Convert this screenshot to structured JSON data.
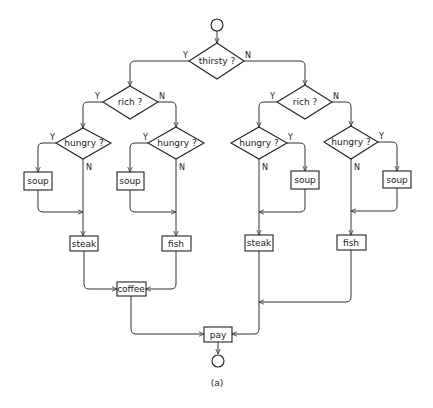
{
  "diagram": {
    "caption": "(a)",
    "nodes": {
      "start": {
        "type": "terminal"
      },
      "thirsty": {
        "type": "decision",
        "label": "thirsty ?",
        "yes": "Y",
        "no": "N"
      },
      "rich_left": {
        "type": "decision",
        "label": "rich ?",
        "yes": "Y",
        "no": "N"
      },
      "rich_right": {
        "type": "decision",
        "label": "rich ?",
        "yes": "Y",
        "no": "N"
      },
      "hungry_1": {
        "type": "decision",
        "label": "hungry ?",
        "yes": "Y",
        "no": "N"
      },
      "hungry_2": {
        "type": "decision",
        "label": "hungry ?",
        "yes": "Y",
        "no": "N"
      },
      "hungry_3": {
        "type": "decision",
        "label": "hungry ?",
        "yes": "Y",
        "no": "N"
      },
      "hungry_4": {
        "type": "decision",
        "label": "hungry ?",
        "yes": "Y",
        "no": "N"
      },
      "soup_1": {
        "type": "process",
        "label": "soup"
      },
      "soup_2": {
        "type": "process",
        "label": "soup"
      },
      "soup_3": {
        "type": "process",
        "label": "soup"
      },
      "soup_4": {
        "type": "process",
        "label": "soup"
      },
      "steak_left": {
        "type": "process",
        "label": "steak"
      },
      "fish_left": {
        "type": "process",
        "label": "fish"
      },
      "steak_right": {
        "type": "process",
        "label": "steak"
      },
      "fish_right": {
        "type": "process",
        "label": "fish"
      },
      "coffee": {
        "type": "process",
        "label": "coffee"
      },
      "pay": {
        "type": "process",
        "label": "pay"
      },
      "end": {
        "type": "terminal"
      }
    },
    "edges": [
      {
        "from": "start",
        "to": "thirsty"
      },
      {
        "from": "thirsty",
        "to": "rich_left",
        "label": "Y"
      },
      {
        "from": "thirsty",
        "to": "rich_right",
        "label": "N"
      },
      {
        "from": "rich_left",
        "to": "hungry_1",
        "label": "Y"
      },
      {
        "from": "rich_left",
        "to": "hungry_2",
        "label": "N"
      },
      {
        "from": "rich_right",
        "to": "hungry_3",
        "label": "Y"
      },
      {
        "from": "rich_right",
        "to": "hungry_4",
        "label": "N"
      },
      {
        "from": "hungry_1",
        "to": "soup_1",
        "label": "Y"
      },
      {
        "from": "hungry_1",
        "to": "steak_left",
        "label": "N"
      },
      {
        "from": "soup_1",
        "to": "steak_left"
      },
      {
        "from": "hungry_2",
        "to": "soup_2",
        "label": "Y"
      },
      {
        "from": "hungry_2",
        "to": "fish_left",
        "label": "N"
      },
      {
        "from": "soup_2",
        "to": "fish_left"
      },
      {
        "from": "hungry_3",
        "to": "soup_3",
        "label": "Y"
      },
      {
        "from": "hungry_3",
        "to": "steak_right",
        "label": "N"
      },
      {
        "from": "soup_3",
        "to": "steak_right"
      },
      {
        "from": "hungry_4",
        "to": "soup_4",
        "label": "Y"
      },
      {
        "from": "hungry_4",
        "to": "fish_right",
        "label": "N"
      },
      {
        "from": "soup_4",
        "to": "fish_right"
      },
      {
        "from": "steak_left",
        "to": "coffee"
      },
      {
        "from": "fish_left",
        "to": "coffee"
      },
      {
        "from": "coffee",
        "to": "pay"
      },
      {
        "from": "steak_right",
        "to": "pay"
      },
      {
        "from": "fish_right",
        "to": "pay"
      },
      {
        "from": "pay",
        "to": "end"
      }
    ]
  }
}
